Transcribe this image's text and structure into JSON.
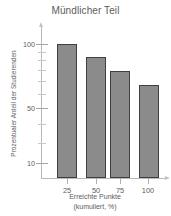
{
  "chart_data": {
    "type": "bar",
    "title": "Mündlicher Teil",
    "xlabel": "Erreichte Punkte",
    "xlabel_line2": "(kumuliert, %)",
    "ylabel": "Prozentualer Anteil der Studierenden",
    "categories": [
      "25",
      "50",
      "75",
      "100"
    ],
    "values": [
      100,
      90,
      70,
      33
    ],
    "series": [
      {
        "name": "Prozentualer Anteil der Studierenden",
        "values": [
          100,
          90,
          70,
          33
        ]
      }
    ],
    "yscale": "log",
    "ylim": [
      7,
      130
    ],
    "ytick_labels": [
      "100",
      "50",
      "10"
    ],
    "ytick_values": [
      100,
      50,
      10
    ],
    "yminor_ticks": [
      90,
      80,
      70,
      60,
      40,
      30,
      20
    ],
    "grid": false,
    "legend": null,
    "bar_color": "#8b8b8b",
    "bar_border_color": "#3f3f3f",
    "axis_color": "#b9b9b9",
    "text_color": "#5c5c5c"
  },
  "axes": {
    "y_major_ticks": [
      {
        "label": "100",
        "top_px": 18
      },
      {
        "label": "50",
        "top_px": 82
      },
      {
        "label": "10",
        "top_px": 137
      }
    ],
    "y_minor_ticks": [
      {
        "top_px": 26
      },
      {
        "top_px": 34
      },
      {
        "top_px": 44
      },
      {
        "top_px": 55
      },
      {
        "top_px": 68
      },
      {
        "top_px": 98
      },
      {
        "top_px": 117
      }
    ],
    "x_ticks": [
      {
        "label": "25",
        "left_px": 26
      },
      {
        "label": "50",
        "left_px": 55
      },
      {
        "label": "75",
        "left_px": 79
      },
      {
        "label": "100",
        "left_px": 107
      }
    ]
  },
  "bars": [
    {
      "name": "bar-25",
      "left_px": 16,
      "width_px": 20,
      "top_px": 18,
      "height_px": 134,
      "value": 100
    },
    {
      "name": "bar-50",
      "left_px": 45,
      "width_px": 20,
      "top_px": 31,
      "height_px": 121,
      "value": 90
    },
    {
      "name": "bar-75",
      "left_px": 69,
      "width_px": 20,
      "top_px": 45,
      "height_px": 107,
      "value": 70
    },
    {
      "name": "bar-100",
      "left_px": 98,
      "width_px": 20,
      "top_px": 59,
      "height_px": 93,
      "value": 33
    }
  ]
}
